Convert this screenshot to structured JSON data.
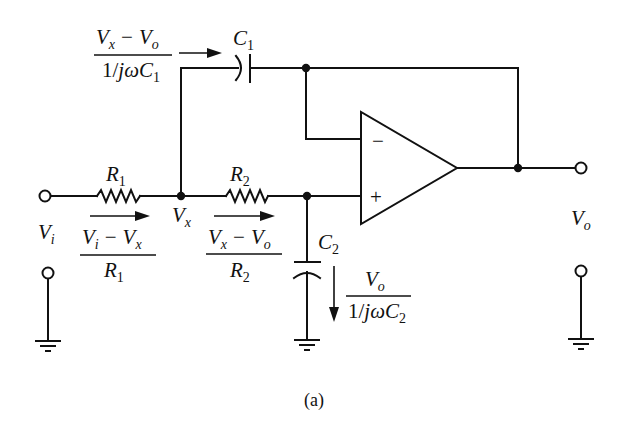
{
  "diagram": {
    "type": "circuit-schematic",
    "caption": "(a)",
    "components": {
      "R1": {
        "label": "R",
        "sub": "1"
      },
      "R2": {
        "label": "R",
        "sub": "2"
      },
      "C1": {
        "label": "C",
        "sub": "1"
      },
      "C2": {
        "label": "C",
        "sub": "2"
      },
      "opamp": {
        "minus": "−",
        "plus": "+"
      }
    },
    "nodes": {
      "Vi": {
        "label": "V",
        "sub": "i"
      },
      "Vx": {
        "label": "V",
        "sub": "x"
      },
      "Vo": {
        "label": "V",
        "sub": "o"
      }
    },
    "currents": {
      "iC1": {
        "num_a": "V",
        "num_a_sub": "x",
        "num_op": "−",
        "num_b": "V",
        "num_b_sub": "o",
        "den_pre": "1/",
        "den_j": "jω",
        "den_c": "C",
        "den_sub": "1"
      },
      "iR1": {
        "num_a": "V",
        "num_a_sub": "i",
        "num_op": "−",
        "num_b": "V",
        "num_b_sub": "x",
        "den": "R",
        "den_sub": "1"
      },
      "iR2": {
        "num_a": "V",
        "num_a_sub": "x",
        "num_op": "−",
        "num_b": "V",
        "num_b_sub": "o",
        "den": "R",
        "den_sub": "2"
      },
      "iC2": {
        "num": "V",
        "num_sub": "o",
        "den_pre": "1/",
        "den_j": "jω",
        "den_c": "C",
        "den_sub": "2"
      }
    }
  }
}
